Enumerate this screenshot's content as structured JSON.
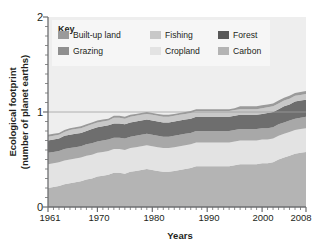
{
  "chart_data": {
    "type": "area",
    "stacked": true,
    "title": "",
    "xlabel": "Years",
    "ylabel": "Ecological footprint (number of planet earths)",
    "ylabel_line1": "Ecological footprint",
    "ylabel_line2": "(number of planet earths)",
    "xlim": [
      1961,
      2008
    ],
    "ylim": [
      0,
      2
    ],
    "yticks": [
      0,
      1,
      2
    ],
    "ytick_labels": [
      "0",
      "1",
      "2"
    ],
    "xticks": [
      1961,
      1970,
      1980,
      1990,
      2000,
      2008
    ],
    "xtick_labels": [
      "1961",
      "1970",
      "1980",
      "1990",
      "2000",
      "2008"
    ],
    "minor_xticks": "every year 1961-2008",
    "minor_yticks": "every 0.1",
    "gridlines": [
      "y=1"
    ],
    "grid": "horizontal reference line at 1.0",
    "legend_title": "Key",
    "legend_position": "inside top-left",
    "x": [
      1961,
      1962,
      1963,
      1964,
      1965,
      1966,
      1967,
      1968,
      1969,
      1970,
      1971,
      1972,
      1973,
      1974,
      1975,
      1976,
      1977,
      1978,
      1979,
      1980,
      1981,
      1982,
      1983,
      1984,
      1985,
      1986,
      1987,
      1988,
      1989,
      1990,
      1991,
      1992,
      1993,
      1994,
      1995,
      1996,
      1997,
      1998,
      1999,
      2000,
      2001,
      2002,
      2003,
      2004,
      2005,
      2006,
      2007,
      2008
    ],
    "series": [
      {
        "name": "Carbon",
        "color": "#b4b4b4",
        "order": 1,
        "values": [
          0.2,
          0.21,
          0.22,
          0.24,
          0.25,
          0.26,
          0.27,
          0.29,
          0.3,
          0.32,
          0.33,
          0.34,
          0.36,
          0.36,
          0.35,
          0.37,
          0.38,
          0.39,
          0.4,
          0.39,
          0.38,
          0.37,
          0.37,
          0.38,
          0.39,
          0.4,
          0.41,
          0.43,
          0.43,
          0.43,
          0.43,
          0.43,
          0.43,
          0.43,
          0.44,
          0.45,
          0.45,
          0.45,
          0.45,
          0.46,
          0.46,
          0.47,
          0.5,
          0.52,
          0.54,
          0.56,
          0.57,
          0.58
        ]
      },
      {
        "name": "Cropland",
        "color": "#e3e3e3",
        "order": 2,
        "values": [
          0.25,
          0.25,
          0.25,
          0.25,
          0.25,
          0.25,
          0.25,
          0.25,
          0.25,
          0.25,
          0.25,
          0.25,
          0.25,
          0.25,
          0.25,
          0.25,
          0.25,
          0.25,
          0.25,
          0.25,
          0.25,
          0.25,
          0.25,
          0.25,
          0.25,
          0.25,
          0.25,
          0.25,
          0.25,
          0.25,
          0.25,
          0.25,
          0.25,
          0.25,
          0.25,
          0.25,
          0.25,
          0.25,
          0.25,
          0.25,
          0.25,
          0.25,
          0.25,
          0.25,
          0.25,
          0.25,
          0.25,
          0.25
        ]
      },
      {
        "name": "Grazing",
        "color": "#a8a8a8",
        "order": 3,
        "values": [
          0.12,
          0.12,
          0.12,
          0.12,
          0.12,
          0.12,
          0.12,
          0.12,
          0.12,
          0.12,
          0.12,
          0.12,
          0.12,
          0.12,
          0.12,
          0.12,
          0.12,
          0.12,
          0.12,
          0.12,
          0.12,
          0.12,
          0.12,
          0.12,
          0.12,
          0.12,
          0.12,
          0.12,
          0.12,
          0.12,
          0.12,
          0.12,
          0.12,
          0.12,
          0.12,
          0.12,
          0.12,
          0.12,
          0.12,
          0.12,
          0.12,
          0.12,
          0.12,
          0.12,
          0.12,
          0.12,
          0.12,
          0.12
        ]
      },
      {
        "name": "Forest",
        "color": "#6e6e6e",
        "order": 4,
        "values": [
          0.13,
          0.13,
          0.13,
          0.14,
          0.14,
          0.14,
          0.14,
          0.14,
          0.15,
          0.15,
          0.15,
          0.15,
          0.15,
          0.15,
          0.15,
          0.15,
          0.15,
          0.15,
          0.15,
          0.15,
          0.15,
          0.15,
          0.15,
          0.15,
          0.15,
          0.15,
          0.15,
          0.15,
          0.15,
          0.15,
          0.15,
          0.15,
          0.15,
          0.15,
          0.15,
          0.15,
          0.15,
          0.15,
          0.15,
          0.15,
          0.16,
          0.16,
          0.16,
          0.17,
          0.17,
          0.18,
          0.18,
          0.18
        ]
      },
      {
        "name": "Fishing",
        "color": "#c8c8c8",
        "order": 5,
        "values": [
          0.04,
          0.04,
          0.04,
          0.04,
          0.05,
          0.05,
          0.05,
          0.05,
          0.05,
          0.05,
          0.05,
          0.05,
          0.06,
          0.06,
          0.06,
          0.06,
          0.06,
          0.06,
          0.06,
          0.06,
          0.06,
          0.06,
          0.06,
          0.06,
          0.06,
          0.06,
          0.06,
          0.06,
          0.06,
          0.06,
          0.06,
          0.06,
          0.06,
          0.06,
          0.06,
          0.06,
          0.06,
          0.06,
          0.06,
          0.06,
          0.06,
          0.06,
          0.06,
          0.06,
          0.06,
          0.06,
          0.06,
          0.06
        ]
      },
      {
        "name": "Built-up land",
        "color": "#9a9a9a",
        "order": 6,
        "values": [
          0.02,
          0.02,
          0.02,
          0.02,
          0.02,
          0.02,
          0.02,
          0.02,
          0.02,
          0.02,
          0.02,
          0.02,
          0.02,
          0.02,
          0.02,
          0.02,
          0.02,
          0.02,
          0.02,
          0.02,
          0.02,
          0.02,
          0.02,
          0.02,
          0.02,
          0.02,
          0.02,
          0.02,
          0.02,
          0.02,
          0.02,
          0.02,
          0.02,
          0.02,
          0.02,
          0.03,
          0.03,
          0.03,
          0.03,
          0.03,
          0.03,
          0.03,
          0.03,
          0.03,
          0.03,
          0.03,
          0.03,
          0.03
        ]
      }
    ],
    "totals": [
      0.76,
      0.77,
      0.78,
      0.81,
      0.83,
      0.84,
      0.85,
      0.87,
      0.89,
      0.91,
      0.92,
      0.93,
      0.96,
      0.96,
      0.95,
      0.97,
      0.98,
      0.99,
      1.0,
      0.99,
      0.98,
      0.97,
      0.97,
      0.98,
      0.99,
      1.0,
      1.01,
      1.03,
      1.03,
      1.03,
      1.03,
      1.03,
      1.03,
      1.03,
      1.04,
      1.06,
      1.06,
      1.06,
      1.06,
      1.07,
      1.08,
      1.09,
      1.12,
      1.15,
      1.17,
      1.2,
      1.21,
      1.22
    ]
  },
  "legend": {
    "title": "Key",
    "items": [
      {
        "label": "Built-up land",
        "color": "#9a9a9a"
      },
      {
        "label": "Fishing",
        "color": "#c8c8c8"
      },
      {
        "label": "Forest",
        "color": "#585858"
      },
      {
        "label": "Grazing",
        "color": "#8f8f8f"
      },
      {
        "label": "Cropland",
        "color": "#e3e3e3"
      },
      {
        "label": "Carbon",
        "color": "#b4b4b4"
      }
    ]
  },
  "axes": {
    "y_title_line1": "Ecological footprint",
    "y_title_line2": "(number of planet earths)",
    "x_title": "Years",
    "y_tick_0": "0",
    "y_tick_1": "1",
    "y_tick_2": "2",
    "x_tick_1961": "1961",
    "x_tick_1970": "1970",
    "x_tick_1980": "1980",
    "x_tick_1990": "1990",
    "x_tick_2000": "2000",
    "x_tick_2008": "2008"
  },
  "colors": {
    "plot_background": "#eeeeee",
    "axis": "#6d6e70",
    "text": "#231f20",
    "legend_background": "#f6f6f6",
    "gridline": "#a0a0a0"
  }
}
